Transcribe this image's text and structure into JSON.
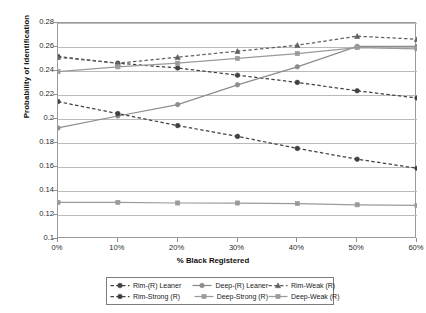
{
  "chart_data": {
    "type": "line",
    "title": "",
    "xlabel": "% Black Registered",
    "ylabel": "Probability of Identification",
    "x": [
      0,
      10,
      20,
      30,
      40,
      50,
      60
    ],
    "categories": [
      "0%",
      "10%",
      "20%",
      "30%",
      "40%",
      "50%",
      "60%"
    ],
    "xlim": [
      0,
      60
    ],
    "ylim": [
      0.1,
      0.28
    ],
    "yticks": [
      0.1,
      0.12,
      0.14,
      0.16,
      0.18,
      0.2,
      0.22,
      0.24,
      0.26,
      0.28
    ],
    "ytick_labels": [
      "0.1",
      "0.12",
      "0.14",
      "0.16",
      "0.18",
      "0.2",
      "0.22",
      "0.24",
      "0.26",
      "0.28"
    ],
    "grid": "horizontal",
    "legend_position": "bottom",
    "series": [
      {
        "name": "Rim-(R) Leaner",
        "values": [
          0.252,
          0.2465,
          0.2425,
          0.2365,
          0.2305,
          0.2235,
          0.2175
        ],
        "color": "#404040",
        "style": "dashed",
        "marker": "circle"
      },
      {
        "name": "Deep-(R) Leaner",
        "values": [
          0.1925,
          0.2025,
          0.212,
          0.2285,
          0.2435,
          0.2605,
          0.2605
        ],
        "color": "#8c8c8c",
        "style": "solid",
        "marker": "circle"
      },
      {
        "name": "Rim-Weak (R)",
        "values": [
          0.2515,
          0.2465,
          0.2515,
          0.2565,
          0.2615,
          0.269,
          0.2665
        ],
        "color": "#606060",
        "style": "dashed",
        "marker": "triangle"
      },
      {
        "name": "Rim-Strong (R)",
        "values": [
          0.2145,
          0.2045,
          0.1945,
          0.1855,
          0.1755,
          0.1665,
          0.159
        ],
        "color": "#404040",
        "style": "dashed",
        "marker": "circle"
      },
      {
        "name": "Deep-Strong (R)",
        "values": [
          0.1305,
          0.1305,
          0.13,
          0.13,
          0.1295,
          0.1285,
          0.128
        ],
        "color": "#9a9a9a",
        "style": "solid",
        "marker": "square"
      },
      {
        "name": "Deep-Weak (R)",
        "values": [
          0.2395,
          0.2435,
          0.2465,
          0.2505,
          0.2545,
          0.2595,
          0.2585
        ],
        "color": "#9a9a9a",
        "style": "solid",
        "marker": "square"
      }
    ]
  },
  "legend": {
    "rows": [
      [
        "Rim-(R) Leaner",
        "Deep-(R) Leaner",
        "Rim-Weak (R)"
      ],
      [
        "Rim-Strong (R)",
        "Deep-Strong (R)",
        "Deep-Weak (R)"
      ]
    ]
  }
}
